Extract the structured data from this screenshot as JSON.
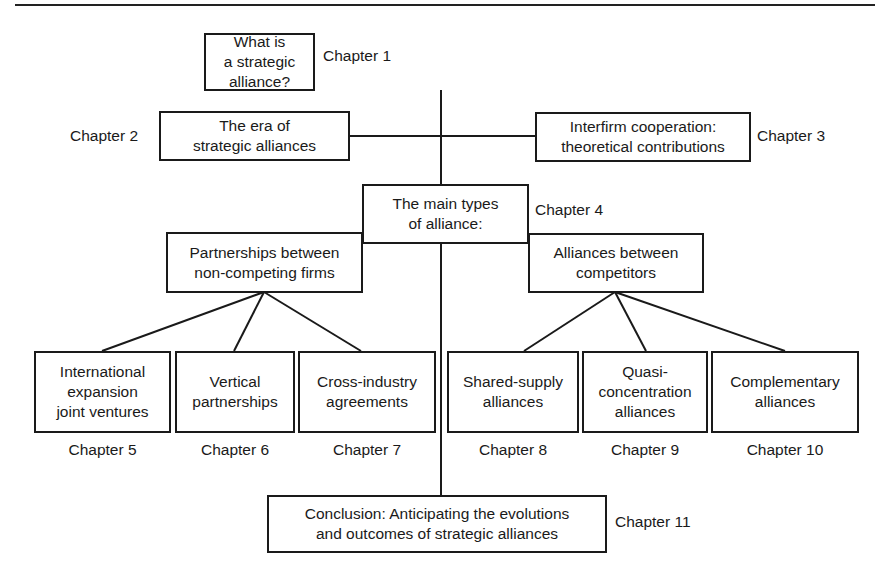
{
  "diagram": {
    "type": "hierarchy",
    "nodes": {
      "root": {
        "text": "What is\na strategic alliance?",
        "chapter": "Chapter 1"
      },
      "era": {
        "text": "The era of\nstrategic alliances",
        "chapter": "Chapter 2"
      },
      "interfirm": {
        "text": "Interfirm cooperation:\ntheoretical contributions",
        "chapter": "Chapter 3"
      },
      "main_types": {
        "text": "The main types\nof alliance:",
        "chapter": "Chapter 4"
      },
      "non_competing": {
        "text": "Partnerships between\nnon-competing firms"
      },
      "competitors": {
        "text": "Alliances between\ncompetitors"
      },
      "leaves": [
        {
          "text": "International\nexpansion\njoint ventures",
          "chapter": "Chapter 5"
        },
        {
          "text": "Vertical\npartnerships",
          "chapter": "Chapter 6"
        },
        {
          "text": "Cross-industry\nagreements",
          "chapter": "Chapter 7"
        },
        {
          "text": "Shared-supply\nalliances",
          "chapter": "Chapter 8"
        },
        {
          "text": "Quasi-\nconcentration\nalliances",
          "chapter": "Chapter 9"
        },
        {
          "text": "Complementary\nalliances",
          "chapter": "Chapter 10"
        }
      ],
      "conclusion": {
        "text": "Conclusion: Anticipating the evolutions\nand outcomes of strategic alliances",
        "chapter": "Chapter 11"
      }
    },
    "edges": [
      [
        "root",
        "main_types"
      ],
      [
        "main_types",
        "era"
      ],
      [
        "main_types",
        "interfirm"
      ],
      [
        "main_types",
        "non_competing"
      ],
      [
        "main_types",
        "competitors"
      ],
      [
        "non_competing",
        "leaves.0"
      ],
      [
        "non_competing",
        "leaves.1"
      ],
      [
        "non_competing",
        "leaves.2"
      ],
      [
        "competitors",
        "leaves.3"
      ],
      [
        "competitors",
        "leaves.4"
      ],
      [
        "competitors",
        "leaves.5"
      ],
      [
        "main_types",
        "conclusion"
      ]
    ]
  }
}
